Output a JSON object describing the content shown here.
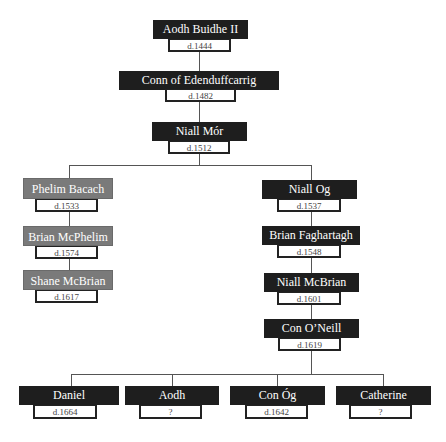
{
  "diagram": {
    "type": "family-tree",
    "colors": {
      "main_line_box": "#1e1e1e",
      "side_line_box": "#7a7a7a",
      "connector": "#555555"
    },
    "nodes": [
      {
        "id": "aodh-buidhe-ii",
        "name": "Aodh Buidhe II",
        "date": "d.1444",
        "style": "dark"
      },
      {
        "id": "conn-of-edenduffcarrig",
        "name": "Conn of Edenduffcarrig",
        "date": "d.1482",
        "style": "dark"
      },
      {
        "id": "niall-mor",
        "name": "Niall Mór",
        "date": "d.1512",
        "style": "dark"
      },
      {
        "id": "phelim-bacach",
        "name": "Phelim Bacach",
        "date": "d.1533",
        "style": "grey"
      },
      {
        "id": "brian-mcphelim",
        "name": "Brian McPhelim",
        "date": "d.1574",
        "style": "grey"
      },
      {
        "id": "shane-mcbrian",
        "name": "Shane McBrian",
        "date": "d.1617",
        "style": "grey"
      },
      {
        "id": "niall-og",
        "name": "Niall Og",
        "date": "d.1537",
        "style": "dark"
      },
      {
        "id": "brian-faghartagh",
        "name": "Brian Faghartagh",
        "date": "d.1548",
        "style": "dark"
      },
      {
        "id": "niall-mcbrian",
        "name": "Niall McBrian",
        "date": "d.1601",
        "style": "dark"
      },
      {
        "id": "con-oneill",
        "name": "Con O’Neill",
        "date": "d.1619",
        "style": "dark"
      },
      {
        "id": "daniel",
        "name": "Daniel",
        "date": "d.1664",
        "style": "dark"
      },
      {
        "id": "aodh",
        "name": "Aodh",
        "date": "?",
        "style": "dark"
      },
      {
        "id": "con-og",
        "name": "Con Óg",
        "date": "d.1642",
        "style": "dark"
      },
      {
        "id": "catherine",
        "name": "Catherine",
        "date": "?",
        "style": "dark"
      }
    ],
    "edges": [
      [
        "aodh-buidhe-ii",
        "conn-of-edenduffcarrig"
      ],
      [
        "conn-of-edenduffcarrig",
        "niall-mor"
      ],
      [
        "niall-mor",
        "phelim-bacach"
      ],
      [
        "niall-mor",
        "niall-og"
      ],
      [
        "phelim-bacach",
        "brian-mcphelim"
      ],
      [
        "brian-mcphelim",
        "shane-mcbrian"
      ],
      [
        "niall-og",
        "brian-faghartagh"
      ],
      [
        "brian-faghartagh",
        "niall-mcbrian"
      ],
      [
        "niall-mcbrian",
        "con-oneill"
      ],
      [
        "con-oneill",
        "daniel"
      ],
      [
        "con-oneill",
        "aodh"
      ],
      [
        "con-oneill",
        "con-og"
      ],
      [
        "con-oneill",
        "catherine"
      ]
    ]
  }
}
